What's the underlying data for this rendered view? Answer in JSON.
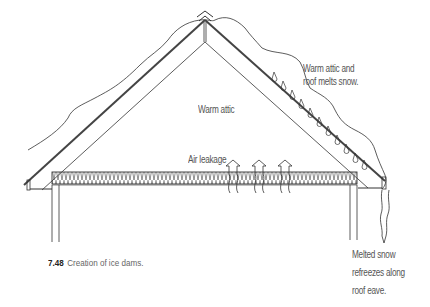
{
  "figure": {
    "number": "7.48",
    "caption": "Creation of ice dams."
  },
  "labels": {
    "warm_attic": "Warm attic",
    "air_leakage": "Air leakage",
    "melts_line1": "Warm attic and",
    "melts_line2": "roof melts snow.",
    "refreeze_line1": "Melted snow",
    "refreeze_line2": "refreezes along",
    "refreeze_line3": "roof eave."
  },
  "colors": {
    "line": "#333333",
    "text": "#555555",
    "background": "#ffffff"
  }
}
